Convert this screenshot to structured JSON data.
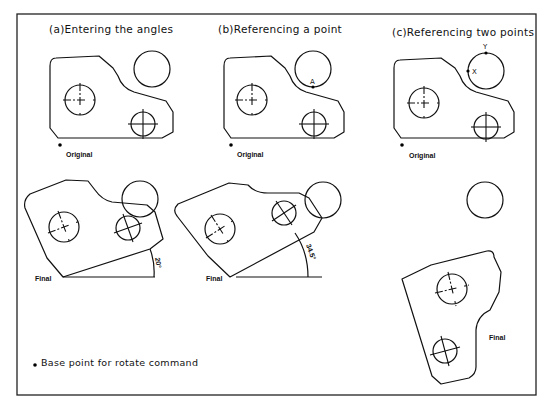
{
  "diagram": {
    "panels": [
      {
        "id": "a",
        "title": "(a)Entering the angles",
        "original_label": "Original",
        "final_label": "Final",
        "rotation_angle_label": "20°"
      },
      {
        "id": "b",
        "title": "(b)Referencing a point",
        "original_label": "Original",
        "final_label": "Final",
        "point_label": "A",
        "rotation_angle_label": "34.5°"
      },
      {
        "id": "c",
        "title": "(c)Referencing two points",
        "original_label": "Original",
        "final_label": "Final",
        "point_labels": [
          "X",
          "Y"
        ]
      }
    ],
    "legend": {
      "marker": "•",
      "text": "Base point for rotate command"
    },
    "colors": {
      "line": "#111111",
      "background": "#ffffff"
    }
  }
}
